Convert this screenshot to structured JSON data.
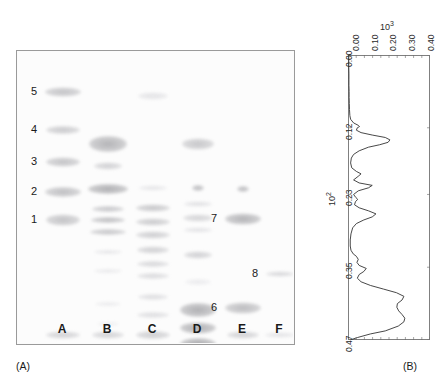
{
  "figure": {
    "panels": [
      {
        "id": "A",
        "caption": "(A)",
        "type": "gel-electrophoresis"
      },
      {
        "id": "B",
        "caption": "(B)",
        "type": "densitometry-trace"
      }
    ]
  },
  "panel_a": {
    "caption": "(A)",
    "lane_labels": [
      "A",
      "B",
      "C",
      "D",
      "E",
      "F"
    ],
    "band_markers": [
      "1",
      "2",
      "3",
      "4",
      "5",
      "6",
      "7",
      "8"
    ],
    "marker_positions": [
      {
        "label": "5",
        "lane": "A",
        "side": "left"
      },
      {
        "label": "4",
        "lane": "A",
        "side": "left"
      },
      {
        "label": "3",
        "lane": "A",
        "side": "left"
      },
      {
        "label": "2",
        "lane": "A",
        "side": "left"
      },
      {
        "label": "1",
        "lane": "A",
        "side": "left"
      },
      {
        "label": "7",
        "lane": "E",
        "side": "left"
      },
      {
        "label": "8",
        "lane": "F",
        "side": "left"
      },
      {
        "label": "6",
        "lane": "E",
        "side": "left"
      }
    ]
  },
  "panel_b": {
    "caption": "(B)",
    "chart_data": {
      "type": "line",
      "title": "",
      "orientation": "vertical-trace",
      "xlabel": "10^3",
      "ylabel": "10^2",
      "x_exponent_label": "10",
      "x_exponent_sup": "3",
      "y_exponent_label": "10",
      "y_exponent_sup": "2",
      "xticks": [
        "0.00",
        "0.10",
        "0.20",
        "0.30",
        "0.40"
      ],
      "xtick_values": [
        0.0,
        0.1,
        0.2,
        0.3,
        0.4
      ],
      "yticks": [
        "0.00",
        "0.12",
        "0.23",
        "0.35",
        "0.47"
      ],
      "ytick_values": [
        0.0,
        0.12,
        0.23,
        0.35,
        0.47
      ],
      "xlim": [
        0.0,
        0.44
      ],
      "ylim": [
        0.0,
        0.47
      ],
      "grid": false,
      "legend": false,
      "peaks": [
        {
          "position": 0.118,
          "amplitude": 0.06
        },
        {
          "position": 0.138,
          "amplitude": 0.22
        },
        {
          "position": 0.196,
          "amplitude": 0.07
        },
        {
          "position": 0.215,
          "amplitude": 0.13
        },
        {
          "position": 0.238,
          "amplitude": 0.05
        },
        {
          "position": 0.262,
          "amplitude": 0.15
        },
        {
          "position": 0.33,
          "amplitude": 0.05
        },
        {
          "position": 0.352,
          "amplitude": 0.1
        },
        {
          "position": 0.392,
          "amplitude": 0.3
        },
        {
          "position": 0.412,
          "amplitude": 0.26
        },
        {
          "position": 0.432,
          "amplitude": 0.31
        }
      ],
      "series": [
        {
          "name": "densitometry",
          "y": [
            0.0,
            0.01,
            0.02,
            0.03,
            0.04,
            0.05,
            0.06,
            0.07,
            0.08,
            0.09,
            0.1,
            0.106,
            0.112,
            0.116,
            0.118,
            0.12,
            0.124,
            0.128,
            0.132,
            0.136,
            0.14,
            0.144,
            0.148,
            0.152,
            0.158,
            0.164,
            0.17,
            0.178,
            0.186,
            0.192,
            0.196,
            0.2,
            0.206,
            0.211,
            0.215,
            0.219,
            0.224,
            0.23,
            0.235,
            0.238,
            0.242,
            0.247,
            0.252,
            0.257,
            0.262,
            0.267,
            0.272,
            0.278,
            0.285,
            0.295,
            0.305,
            0.315,
            0.322,
            0.328,
            0.332,
            0.337,
            0.342,
            0.347,
            0.352,
            0.357,
            0.362,
            0.368,
            0.374,
            0.38,
            0.386,
            0.392,
            0.398,
            0.404,
            0.41,
            0.416,
            0.422,
            0.428,
            0.434,
            0.44,
            0.447,
            0.455,
            0.46,
            0.466,
            0.47
          ],
          "x": [
            0.004,
            0.004,
            0.004,
            0.005,
            0.005,
            0.005,
            0.006,
            0.006,
            0.007,
            0.008,
            0.01,
            0.014,
            0.03,
            0.055,
            0.062,
            0.05,
            0.045,
            0.07,
            0.13,
            0.2,
            0.225,
            0.215,
            0.17,
            0.11,
            0.06,
            0.03,
            0.018,
            0.014,
            0.02,
            0.045,
            0.07,
            0.055,
            0.03,
            0.06,
            0.13,
            0.11,
            0.055,
            0.03,
            0.042,
            0.052,
            0.04,
            0.035,
            0.06,
            0.11,
            0.15,
            0.13,
            0.085,
            0.045,
            0.025,
            0.016,
            0.012,
            0.012,
            0.016,
            0.028,
            0.045,
            0.055,
            0.048,
            0.06,
            0.098,
            0.085,
            0.06,
            0.05,
            0.07,
            0.12,
            0.19,
            0.26,
            0.3,
            0.29,
            0.265,
            0.262,
            0.272,
            0.29,
            0.305,
            0.3,
            0.27,
            0.2,
            0.12,
            0.05,
            0.012
          ]
        }
      ]
    }
  }
}
